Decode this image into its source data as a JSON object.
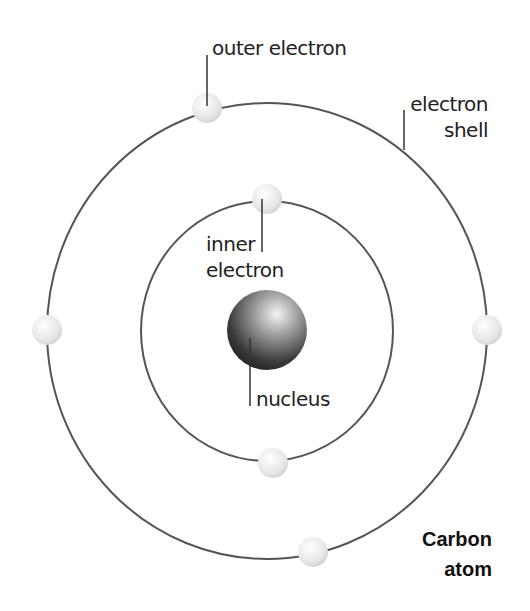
{
  "diagram": {
    "title_line1": "Carbon",
    "title_line2": "atom",
    "labels": {
      "outer_electron": "outer electron",
      "electron_shell_line1": "electron",
      "electron_shell_line2": "shell",
      "inner_electron_line1": "inner",
      "inner_electron_line2": "electron",
      "nucleus": "nucleus"
    },
    "shells": [
      {
        "name": "inner",
        "cx": 267,
        "cy": 331,
        "rx": 126,
        "ry": 130,
        "electrons": 2
      },
      {
        "name": "outer",
        "cx": 267,
        "cy": 331,
        "rx": 220,
        "ry": 228,
        "electrons": 4
      }
    ],
    "colors": {
      "shell_stroke": "#555555",
      "electron_fill": "#eeeeee",
      "nucleus_dark": "#1a1a1a",
      "nucleus_light": "#f0f0f0",
      "text": "#222222"
    }
  }
}
